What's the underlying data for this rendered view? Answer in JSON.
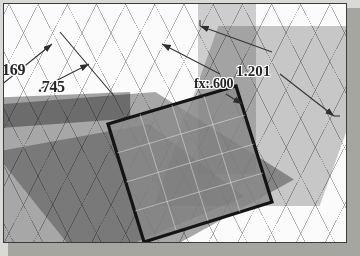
{
  "app": {
    "kind": "cad-3d-modeler",
    "view": "isometric",
    "window_title": "",
    "background_color": "#d9d9d6",
    "canvas_color": "#fbfbfb",
    "border_color": "#3c3c3c",
    "shadow_color": "#a6a6a1"
  },
  "scene": {
    "grid": {
      "visible": true,
      "line_color": "#787880",
      "spacing_px": 26,
      "angle_deg": 63
    },
    "sketch_face": {
      "name": "selected-sketch-profile",
      "outline_color": "#1a1a1a",
      "fill_color": "#8a8a8a",
      "outline_width_px": 3
    },
    "planes": [
      {
        "name": "plane-left",
        "fill": "rgba(118,118,118,0.62)"
      },
      {
        "name": "plane-left-2",
        "fill": "rgba(100,100,100,0.45)"
      },
      {
        "name": "plane-topslab",
        "fill": "rgba(150,150,150,0.50)"
      },
      {
        "name": "plane-vertical",
        "fill": "rgba(255,255,255,0.42)"
      },
      {
        "name": "plane-vertical-2",
        "fill": "rgba(120,120,120,0.34)"
      }
    ]
  },
  "dimensions": [
    {
      "id": "dim-169",
      "label": "169",
      "value": "169",
      "kind": "linear-dimension",
      "position": "upper-left"
    },
    {
      "id": "dim-745",
      "label": ".745",
      "value": ".745",
      "kind": "linear-dimension",
      "position": "upper-left-lower"
    },
    {
      "id": "dim-1201",
      "label": "1.201",
      "value": "1.201",
      "kind": "linear-dimension",
      "position": "upper-right"
    },
    {
      "id": "dim-600",
      "label": "fx:.600",
      "value": ".600",
      "prefix": "fx:",
      "kind": "driven-equation-dimension",
      "position": "center-right"
    }
  ],
  "annotation_style": {
    "text_color": "#262626",
    "leader_color": "#3a3a3a",
    "halo_color": "#ffffff"
  }
}
